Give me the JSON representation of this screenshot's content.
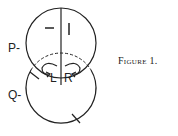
{
  "figure": {
    "caption": "Figure 1.",
    "labels": {
      "upper_circle": "P-",
      "lower_circle": "Q-",
      "upper_left_region": "–",
      "upper_right_region": "I",
      "left_lower": "L",
      "right_lower": "R"
    },
    "colors": {
      "stroke": "#222222",
      "background": "#ffffff"
    }
  }
}
